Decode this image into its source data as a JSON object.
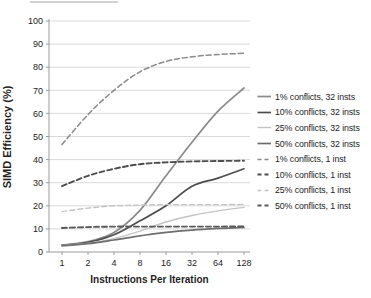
{
  "chart_data": {
    "type": "line",
    "title": "",
    "xlabel": "Instructions Per Iteration",
    "ylabel": "SIMD Efficiency (%)",
    "x_scale": "log2",
    "x_ticks": [
      1,
      2,
      4,
      8,
      16,
      32,
      64,
      128
    ],
    "y_ticks": [
      0,
      10,
      20,
      30,
      40,
      50,
      60,
      70,
      80,
      90,
      100
    ],
    "ylim": [
      0,
      100
    ],
    "grid": "horizontal",
    "legend_position": "right",
    "series": [
      {
        "name": "1% conflicts, 32 insts",
        "style": "solid",
        "color": "#8a8a8a",
        "width": 1.7,
        "values": [
          3.0,
          4.5,
          8.5,
          18.0,
          33.0,
          47.5,
          61.0,
          71.0
        ]
      },
      {
        "name": "10% conflicts, 32 insts",
        "style": "solid",
        "color": "#4d4d4d",
        "width": 1.7,
        "values": [
          2.9,
          4.2,
          7.5,
          13.5,
          20.0,
          28.5,
          32.0,
          36.0
        ]
      },
      {
        "name": "25% conflicts, 32 insts",
        "style": "solid",
        "color": "#c4c4c4",
        "width": 1.4,
        "values": [
          2.8,
          3.8,
          5.8,
          9.0,
          13.0,
          15.8,
          17.8,
          19.3
        ]
      },
      {
        "name": "50% conflicts, 32 insts",
        "style": "solid",
        "color": "#6e6e6e",
        "width": 1.7,
        "values": [
          2.7,
          3.6,
          5.2,
          7.0,
          8.5,
          9.5,
          10.2,
          10.6
        ]
      },
      {
        "name": "1% conflicts, 1 inst",
        "style": "dashed",
        "color": "#8a8a8a",
        "width": 1.5,
        "values": [
          46.5,
          59.5,
          70.0,
          78.0,
          82.5,
          84.5,
          85.5,
          86.0
        ]
      },
      {
        "name": "10% conflicts, 1 inst",
        "style": "dashed",
        "color": "#4d4d4d",
        "width": 1.9,
        "values": [
          28.5,
          33.0,
          36.0,
          38.0,
          38.8,
          39.2,
          39.4,
          39.5
        ]
      },
      {
        "name": "25% conflicts, 1 inst",
        "style": "dashed",
        "color": "#c4c4c4",
        "width": 1.4,
        "values": [
          17.5,
          19.0,
          20.0,
          20.3,
          20.5,
          20.5,
          20.5,
          20.6
        ]
      },
      {
        "name": "50% conflicts, 1 inst",
        "style": "dashed",
        "color": "#585858",
        "width": 1.9,
        "values": [
          10.4,
          10.8,
          11.0,
          11.0,
          11.0,
          11.0,
          11.0,
          11.1
        ]
      }
    ]
  },
  "colors": {
    "background": "#ffffff",
    "gridline": "#d9d9d9",
    "axis": "#9a9a9a",
    "text": "#1c1c1c"
  }
}
